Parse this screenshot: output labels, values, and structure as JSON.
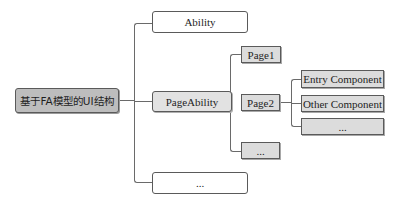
{
  "diagram": {
    "type": "tree",
    "root": {
      "label": "基于FA模型的UI结构"
    },
    "level1": [
      {
        "label": "Ability"
      },
      {
        "label": "PageAbility"
      },
      {
        "label": "..."
      }
    ],
    "level2": [
      {
        "label": "Page1"
      },
      {
        "label": "Page2"
      },
      {
        "label": "..."
      }
    ],
    "level3": [
      {
        "label": "Entry Component"
      },
      {
        "label": "Other Component"
      },
      {
        "label": "..."
      }
    ],
    "edges": [
      [
        "基于FA模型的UI结构",
        "Ability"
      ],
      [
        "基于FA模型的UI结构",
        "PageAbility"
      ],
      [
        "基于FA模型的UI结构",
        "..."
      ],
      [
        "PageAbility",
        "Page1"
      ],
      [
        "PageAbility",
        "Page2"
      ],
      [
        "PageAbility",
        "..."
      ],
      [
        "Page2",
        "Entry Component"
      ],
      [
        "Page2",
        "Other Component"
      ],
      [
        "Page2",
        "..."
      ]
    ],
    "colors": {
      "root_fill": "#bdbdbd",
      "level1_white_fill": "#ffffff",
      "level1_gray_fill": "#e2e2e2",
      "leaf_fill": "#dcdcdc",
      "line": "#6a6a6a",
      "text": "#1e1e1e"
    }
  }
}
